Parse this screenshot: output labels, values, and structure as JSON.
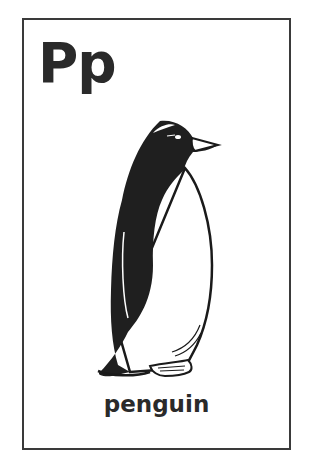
{
  "card": {
    "letter": "Pp",
    "word": "penguin",
    "illustration": "penguin-illustration"
  },
  "colors": {
    "ink": "#2a2a2a",
    "border": "#3a3a3a",
    "background": "#ffffff"
  }
}
